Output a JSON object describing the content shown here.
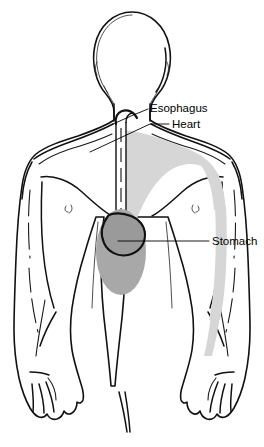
{
  "figure": {
    "background_color": "#ffffff",
    "outline_color": "#111111",
    "view": "anterior human body, bald featureless head, arms at sides"
  },
  "labels": [
    {
      "id": "esophagus",
      "text": "Esophagus",
      "text_x": 150,
      "text_y": 112,
      "leader": "M148,109 L131,116 L113,124",
      "interactable": false
    },
    {
      "id": "heart",
      "text": "Heart",
      "text_x": 172,
      "text_y": 128,
      "leader": "M169,124 L150,124 L90,152",
      "interactable": false
    },
    {
      "id": "stomach",
      "text": "Stomach",
      "text_x": 212,
      "text_y": 245,
      "leader": "M209,241 L118,241",
      "interactable": false
    }
  ],
  "regions": [
    {
      "id": "heart-referred-area",
      "name": "heart",
      "fill_color": "#d6d6d6",
      "description": "light gray shaded region over left chest extending down inner left arm"
    },
    {
      "id": "stomach-referred-area",
      "name": "stomach",
      "fill_color": "#a8a8a8",
      "description": "darker gray vertical ellipse over epigastrium"
    },
    {
      "id": "esophagus-tube",
      "name": "esophagus",
      "fill_color": "#ffffff",
      "description": "narrow vertical tube from neck down midline of chest"
    }
  ],
  "colors": {
    "background": "#ffffff",
    "line": "#111111",
    "heart_shade": "#d6d6d6",
    "stomach_shade": "#a8a8a8",
    "text": "#000000"
  }
}
